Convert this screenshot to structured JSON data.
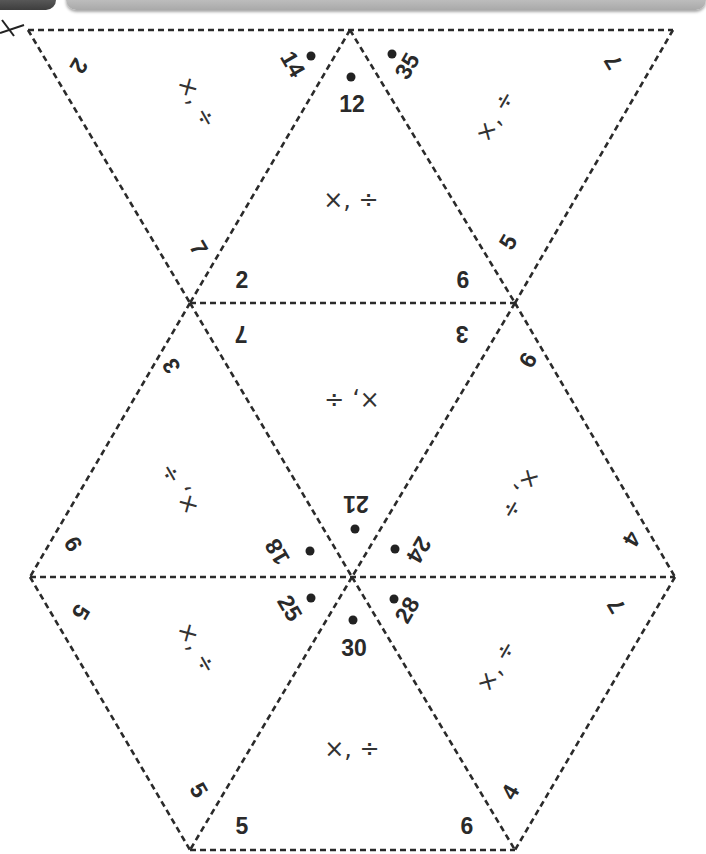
{
  "header": {
    "bar_left_color": "#5a5a5a",
    "bar_right_color": "#c8c8c8"
  },
  "icons": {
    "scissors": "scissors-icon"
  },
  "colors": {
    "line": "#2a2a2a",
    "text": "#2a2a2a",
    "background": "#ffffff"
  },
  "puzzle": {
    "type": "hexagon tarsia of 18 triangular edges",
    "operations_label": "×, ÷",
    "top_row": {
      "left_triangle": {
        "left_edge": "2",
        "right_edge": "14",
        "op": "×, ÷"
      },
      "center_triangle": {
        "top": "12",
        "bottom_left": "2",
        "bottom_right": "6",
        "op": "×, ÷"
      },
      "right_triangle": {
        "left_edge": "35",
        "right_edge": "7",
        "op": "×, ÷",
        "lower_edge": "5"
      },
      "left_lower_edge": "7"
    },
    "middle_row": {
      "center_triangle": {
        "top_left": "7",
        "top_right": "3",
        "bottom": "21",
        "op": "×, ÷"
      },
      "left_triangle": {
        "top": "3",
        "bottom_left": "9",
        "bottom_right": "18",
        "op": "×, ÷"
      },
      "right_triangle": {
        "top": "9",
        "bottom_left": "24",
        "bottom_right": "4",
        "op": "×, ÷"
      }
    },
    "bottom_row": {
      "left_triangle": {
        "left_edge": "5",
        "right_edge": "25",
        "lower_edge": "5",
        "op": "×, ÷"
      },
      "center_triangle": {
        "top": "30",
        "bottom_left": "5",
        "bottom_right": "6",
        "op": "×, ÷"
      },
      "right_triangle": {
        "left_edge": "28",
        "right_edge": "7",
        "lower_edge": "4",
        "op": "×, ÷"
      }
    }
  }
}
